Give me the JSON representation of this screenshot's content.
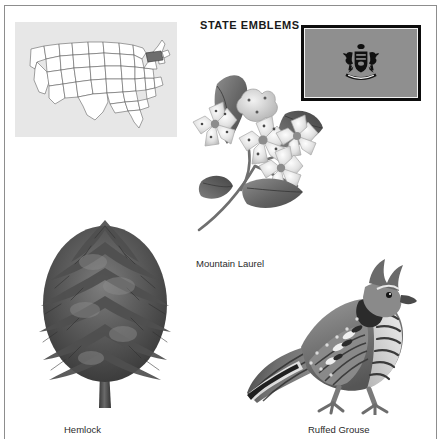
{
  "page": {
    "title": "STATE EMBLEMS",
    "state": "Pennsylvania",
    "frame_color": "#8d8d8d",
    "background": "#ffffff"
  },
  "map": {
    "name": "united-states-locator-map",
    "panel_color": "#e7e7e7",
    "outline_color": "#4a4a4a",
    "highlight_color": "#6d6d6d",
    "highlighted_state": "Pennsylvania"
  },
  "flag": {
    "name": "pennsylvania-state-flag",
    "field_color": "#8f8f8f",
    "border_color": "#0d0d0d",
    "emblem": "coat-of-arms",
    "emblem_color": "#101010"
  },
  "emblems": [
    {
      "id": "flower",
      "label": "Mountain Laurel",
      "illustration": "mountain-laurel-flower"
    },
    {
      "id": "tree",
      "label": "Hemlock",
      "illustration": "hemlock-tree"
    },
    {
      "id": "bird",
      "label": "Ruffed Grouse",
      "illustration": "ruffed-grouse-bird"
    }
  ]
}
